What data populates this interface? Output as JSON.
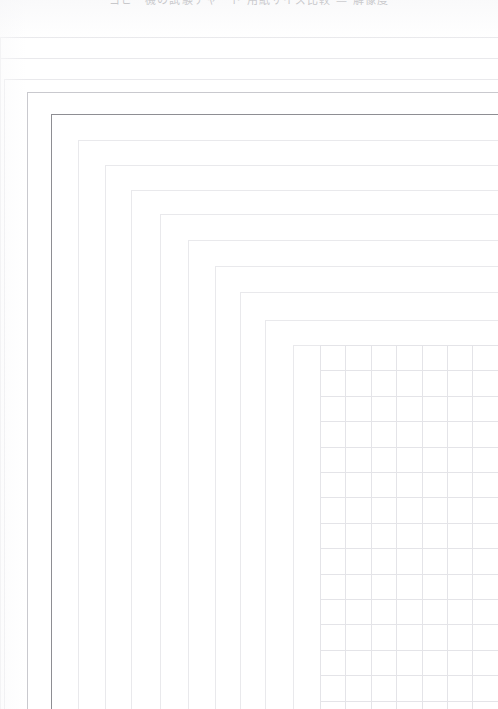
{
  "document": {
    "kind": "scanned-sheet",
    "width": 498,
    "height": 709,
    "background_color": "#ffffff"
  },
  "top_caption": {
    "text": "コピー機の試験チャート 用紙サイズ比較 — 解像度",
    "note_clipped": "clipped-at-top-edge",
    "color": "#9a9a9e"
  },
  "colors": {
    "ink_dark": "#8e8e93",
    "ink_soft": "#c9c9ce",
    "hairline": "#e9e9ec",
    "grid_line": "#e4e4e8",
    "paper": "#ffffff"
  },
  "frames": [
    {
      "name": "frame-outer-1",
      "left": 0,
      "top": 37,
      "weight": "hairline"
    },
    {
      "name": "frame-outer-2",
      "left": 0,
      "top": 58,
      "weight": "hairline"
    },
    {
      "name": "frame-3",
      "left": 4,
      "top": 79,
      "weight": "hairline"
    },
    {
      "name": "frame-4",
      "left": 27,
      "top": 92,
      "weight": "soft"
    },
    {
      "name": "frame-main",
      "left": 51,
      "top": 114,
      "weight": "dark"
    },
    {
      "name": "frame-6",
      "left": 78,
      "top": 140,
      "weight": "hairline"
    },
    {
      "name": "frame-7",
      "left": 105,
      "top": 165,
      "weight": "hairline"
    },
    {
      "name": "frame-8",
      "left": 131,
      "top": 190,
      "weight": "hairline"
    },
    {
      "name": "frame-9",
      "left": 160,
      "top": 214,
      "weight": "hairline"
    },
    {
      "name": "frame-10",
      "left": 188,
      "top": 240,
      "weight": "hairline"
    },
    {
      "name": "frame-11",
      "left": 215,
      "top": 266,
      "weight": "hairline"
    },
    {
      "name": "frame-12",
      "left": 240,
      "top": 292,
      "weight": "hairline"
    },
    {
      "name": "frame-13",
      "left": 265,
      "top": 320,
      "weight": "hairline"
    },
    {
      "name": "frame-14",
      "left": 293,
      "top": 345,
      "weight": "hairline"
    }
  ],
  "grid": {
    "name": "resolution-grid",
    "left": 320,
    "top": 345,
    "right": 498,
    "bottom": 709,
    "cell_size": 25.4,
    "columns": 7,
    "rows": 15,
    "line_color": "#e4e4e8"
  }
}
